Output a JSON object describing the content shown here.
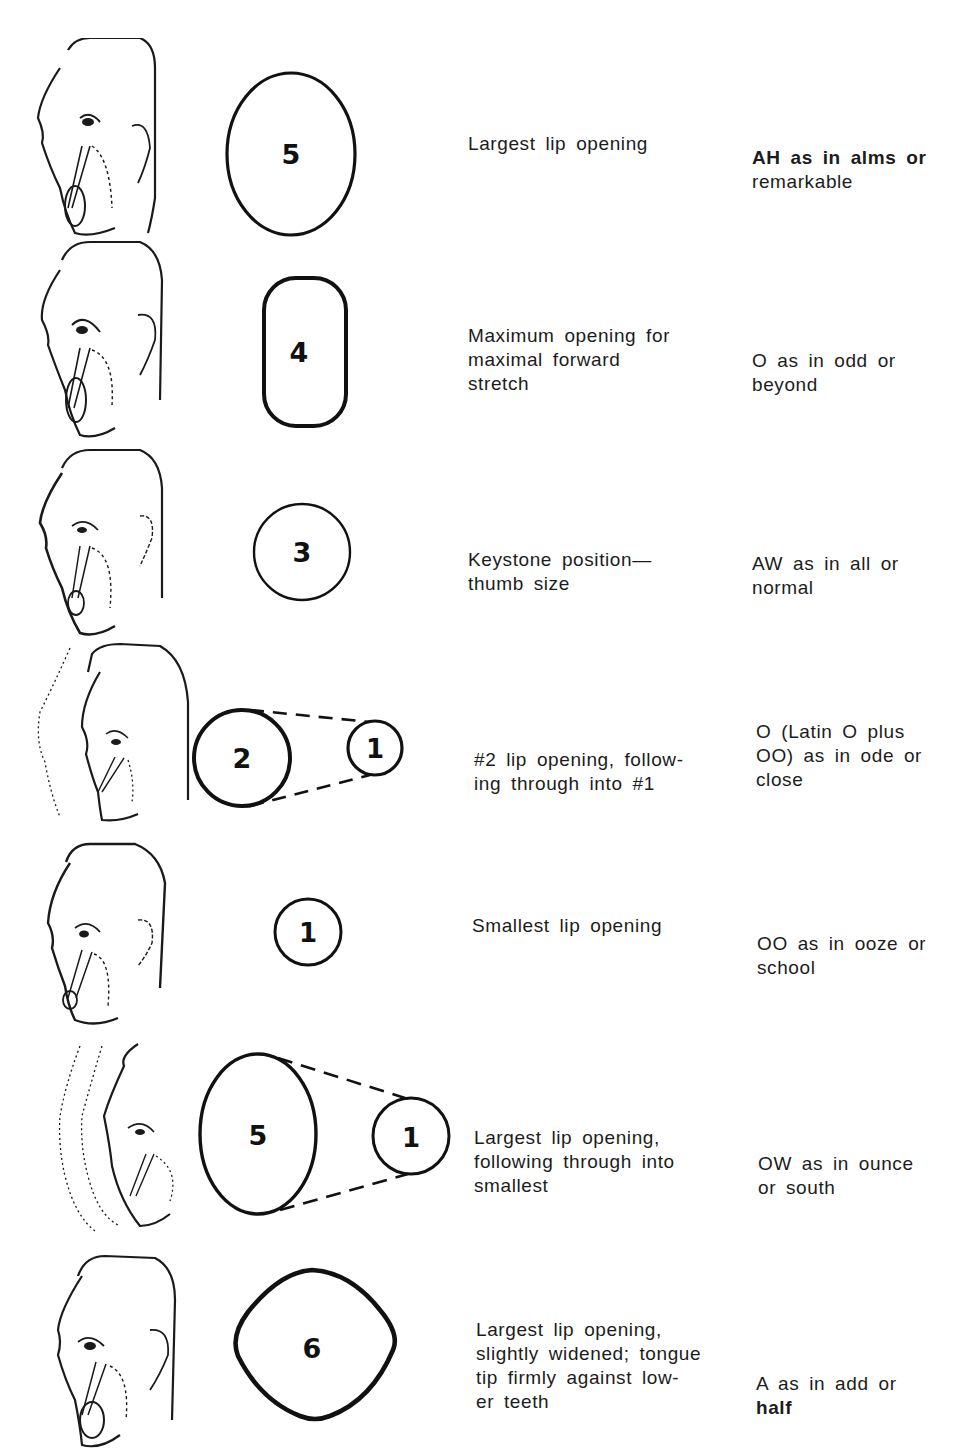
{
  "figure": {
    "title": "",
    "rows": [
      {
        "shape_type": "oval",
        "positions": [
          "5"
        ],
        "description": "Largest lip opening",
        "sound": "AH as in alms or remarkable",
        "sound_lines": [
          "AH as in alms or",
          "remarkable"
        ]
      },
      {
        "shape_type": "rounded-rect",
        "positions": [
          "4"
        ],
        "description": "Maximum opening for maximal forward stretch",
        "description_lines": [
          "Maximum opening for",
          "maximal forward",
          "stretch"
        ],
        "sound": "O as in odd or beyond",
        "sound_lines": [
          "O as in odd or",
          "beyond"
        ]
      },
      {
        "shape_type": "circle",
        "positions": [
          "3"
        ],
        "description": "Keystone position—thumb size",
        "description_lines": [
          "Keystone position—",
          "thumb size"
        ],
        "sound": "AW as in all or normal",
        "sound_lines": [
          "AW as in all or",
          "normal"
        ]
      },
      {
        "shape_type": "transition",
        "positions": [
          "2",
          "1"
        ],
        "description": "#2 lip opening, following through into #1",
        "description_lines": [
          "#2 lip opening, follow-",
          "ing through into #1"
        ],
        "sound": "O (Latin O plus OO) as in ode or close",
        "sound_lines": [
          "O (Latin O plus",
          "OO) as in ode or",
          "close"
        ]
      },
      {
        "shape_type": "small-circle",
        "positions": [
          "1"
        ],
        "description": "Smallest lip opening",
        "sound": "OO as in ooze or school",
        "sound_lines": [
          "OO as in ooze or",
          "school"
        ]
      },
      {
        "shape_type": "transition",
        "positions": [
          "5",
          "1"
        ],
        "description": "Largest lip opening, following through into smallest",
        "description_lines": [
          "Largest lip opening,",
          "following through into",
          "smallest"
        ],
        "sound": "OW as in ounce or south",
        "sound_lines": [
          "OW as in ounce",
          "or south"
        ]
      },
      {
        "shape_type": "rounded-diamond",
        "positions": [
          "6"
        ],
        "description": "Largest lip opening, slightly widened; tongue tip firmly against lower teeth",
        "description_lines": [
          "Largest lip opening,",
          "slightly widened; tongue",
          "tip firmly against low-",
          "er teeth"
        ],
        "sound": "A as in add or half",
        "sound_lines": [
          "A as in add or",
          "half"
        ]
      }
    ]
  },
  "colors": {
    "ink": "#1a1a1a",
    "paper": "#ffffff"
  },
  "icons": {
    "face": "profile-face-drawing-icon",
    "lip_shape": "lip-opening-shape-icon"
  }
}
